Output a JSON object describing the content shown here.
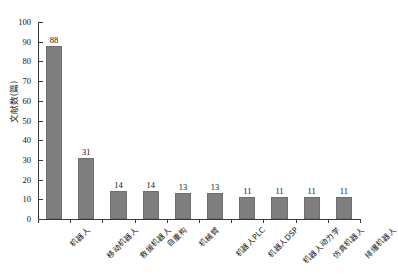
{
  "chart_data": {
    "type": "bar",
    "title": "",
    "xlabel": "",
    "ylabel": "文献数(篇)",
    "ylim": [
      0,
      100
    ],
    "yticks": [
      0,
      10,
      20,
      30,
      40,
      50,
      60,
      70,
      80,
      90,
      100
    ],
    "grid": false,
    "legend": null,
    "orientation": "vertical",
    "bar_color": "#7f7f7f",
    "value_labels": true,
    "xtick_rotation": -45,
    "categories": [
      "机器人",
      "移动机器人",
      "救援机器人",
      "自重构",
      "机械臂",
      "机器人PLC",
      "机器人DSP",
      "机器人动力学",
      "仿真机器人",
      "排爆机器人"
    ],
    "values": [
      88,
      31,
      14,
      14,
      13,
      13,
      11,
      11,
      11,
      11
    ]
  },
  "colors": {
    "bar": "#7f7f7f",
    "axis": "#3a3a3a",
    "text": "#111111",
    "background": "#ffffff"
  }
}
